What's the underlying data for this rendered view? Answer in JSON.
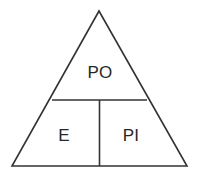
{
  "diagram": {
    "type": "triangle-partition",
    "shape_name": "triangle",
    "background_color": "#ffffff",
    "stroke_color": "#333333",
    "stroke_width": 1.6,
    "text_color": "#262626",
    "geometry": {
      "apex": [
        99,
        11
      ],
      "bottom_left": [
        12,
        166
      ],
      "bottom_right": [
        187,
        166
      ],
      "horizontal_divider": {
        "y": 100,
        "x_start": 52,
        "x_end": 147
      },
      "vertical_divider": {
        "x": 99.5,
        "y_start": 100,
        "y_end": 166
      }
    },
    "regions": [
      {
        "id": "region-top",
        "label": "PO",
        "position": [
          100,
          73
        ]
      },
      {
        "id": "region-bottom-left",
        "label": "E",
        "position": [
          64,
          136
        ]
      },
      {
        "id": "region-bottom-right",
        "label": "PI",
        "position": [
          131,
          136
        ]
      }
    ]
  }
}
